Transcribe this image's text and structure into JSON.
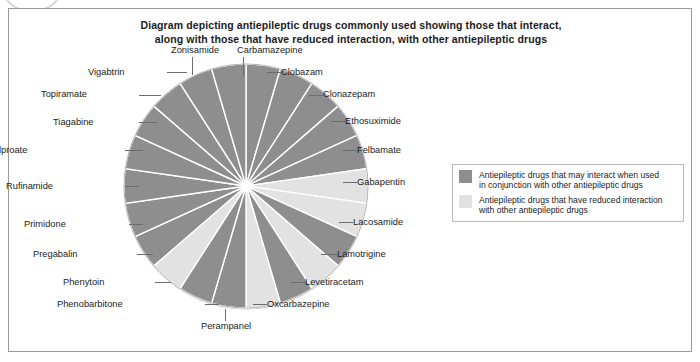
{
  "title": {
    "line1": "Diagram depicting antiepileptic drugs commonly used showing those that interact,",
    "line2": "along with those that have reduced interaction, with other antiepileptic drugs"
  },
  "legend": {
    "items": [
      {
        "swatch_name": "legend-swatch-interacting",
        "color": "#8e8e8e",
        "line1": "Antiepileptic drugs that may interact when used",
        "line2": "in conjunction with other antiepileptic drugs"
      },
      {
        "swatch_name": "legend-swatch-reduced",
        "color": "#e2e2e2",
        "line1": "Antiepileptic drugs that have reduced interaction",
        "line2": "with other antiepileptic drugs"
      }
    ]
  },
  "colors": {
    "interacting": "#8e8e8e",
    "reduced": "#e2e2e2",
    "slice_edge": "#ffffff",
    "pie_outline": "#b5b5b5",
    "leader": "#6d6d6d",
    "frame": "#9a9a9a"
  },
  "chart_data": {
    "type": "pie",
    "title": "Diagram depicting antiepileptic drugs commonly used showing those that interact, along with those that have reduced interaction, with other antiepileptic drugs",
    "legend_position": "right",
    "equal_slices": true,
    "slice_count": 22,
    "slice_value": 4.55,
    "start_angle_deg": -90,
    "direction": "clockwise",
    "categories": [
      "Carbamazepine",
      "Clobazam",
      "Clonazepam",
      "Ethosuximide",
      "Felbamate",
      "Gabapentin",
      "Lacosamide",
      "Lamotrigine",
      "Levetiracetam",
      "Oxcarbazepine",
      "Perampanel",
      "Phenobarbitone",
      "Phenytoin",
      "Pregabalin",
      "Primidone",
      "Rufinamide",
      "Sodium valproate",
      "Tiagabine",
      "Topiramate",
      "Vigabtrin",
      "Zonisamide",
      "Clonazepam-2"
    ],
    "values": [
      4.55,
      4.55,
      4.55,
      4.55,
      4.55,
      4.55,
      4.55,
      4.55,
      4.55,
      4.55,
      4.55,
      4.55,
      4.55,
      4.55,
      4.55,
      4.55,
      4.55,
      4.55,
      4.55,
      4.55,
      4.55,
      4.55
    ],
    "series": [
      {
        "name": "Antiepileptic drugs",
        "points": [
          {
            "label": "Carbamazepine",
            "group": "interacting"
          },
          {
            "label": "Clobazam",
            "group": "interacting"
          },
          {
            "label": "Clonazepam",
            "group": "interacting"
          },
          {
            "label": "Ethosuximide",
            "group": "interacting"
          },
          {
            "label": "Felbamate",
            "group": "interacting"
          },
          {
            "label": "Gabapentin",
            "group": "reduced"
          },
          {
            "label": "Lacosamide",
            "group": "reduced"
          },
          {
            "label": "Lamotrigine",
            "group": "interacting"
          },
          {
            "label": "Levetiracetam",
            "group": "reduced"
          },
          {
            "label": "Oxcarbazepine",
            "group": "interacting"
          },
          {
            "label": "Perampanel",
            "group": "reduced"
          },
          {
            "label": "Phenobarbitone",
            "group": "interacting"
          },
          {
            "label": "Phenytoin",
            "group": "interacting"
          },
          {
            "label": "Pregabalin",
            "group": "reduced"
          },
          {
            "label": "Primidone",
            "group": "interacting"
          },
          {
            "label": "Rufinamide",
            "group": "interacting"
          },
          {
            "label": "Sodium valproate",
            "group": "interacting"
          },
          {
            "label": "Tiagabine",
            "group": "interacting"
          },
          {
            "label": "Topiramate",
            "group": "interacting"
          },
          {
            "label": "Vigabtrin",
            "group": "interacting"
          },
          {
            "label": "Zonisamide",
            "group": "interacting"
          },
          {
            "label": "Clonazepam-2",
            "group": "interacting"
          }
        ]
      }
    ],
    "groups": {
      "interacting": {
        "color": "#8e8e8e",
        "legend": "Antiepileptic drugs that may interact when used in conjunction with other antiepileptic drugs"
      },
      "reduced": {
        "color": "#e2e2e2",
        "legend": "Antiepileptic drugs that have reduced interaction with other antiepileptic drugs"
      }
    }
  },
  "labels": [
    {
      "text": "Carbamazepine",
      "name": "pie-label-carbamazepine"
    },
    {
      "text": "Clobazam",
      "name": "pie-label-clobazam"
    },
    {
      "text": "Clonazepam",
      "name": "pie-label-clonazepam"
    },
    {
      "text": "Ethosuximide",
      "name": "pie-label-ethosuximide"
    },
    {
      "text": "Felbamate",
      "name": "pie-label-felbamate"
    },
    {
      "text": "Gabapentin",
      "name": "pie-label-gabapentin"
    },
    {
      "text": "Lacosamide",
      "name": "pie-label-lacosamide"
    },
    {
      "text": "Lamotrigine",
      "name": "pie-label-lamotrigine"
    },
    {
      "text": "Levetiracetam",
      "name": "pie-label-levetiracetam"
    },
    {
      "text": "Oxcarbazepine",
      "name": "pie-label-oxcarbazepine"
    },
    {
      "text": "Perampanel",
      "name": "pie-label-perampanel"
    },
    {
      "text": "Phenobarbitone",
      "name": "pie-label-phenobarbitone"
    },
    {
      "text": "Phenytoin",
      "name": "pie-label-phenytoin"
    },
    {
      "text": "Pregabalin",
      "name": "pie-label-pregabalin"
    },
    {
      "text": "Primidone",
      "name": "pie-label-primidone"
    },
    {
      "text": "Rufinamide",
      "name": "pie-label-rufinamide"
    },
    {
      "text": "Sodium valproate",
      "name": "pie-label-sodium-valproate"
    },
    {
      "text": "Tiagabine",
      "name": "pie-label-tiagabine"
    },
    {
      "text": "Topiramate",
      "name": "pie-label-topiramate"
    },
    {
      "text": "Vigabtrin",
      "name": "pie-label-vigabtrin"
    },
    {
      "text": "Zonisamide",
      "name": "pie-label-zonisamide"
    }
  ]
}
